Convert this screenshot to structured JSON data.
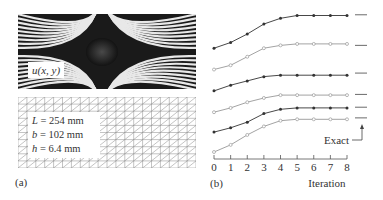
{
  "panel_a": {
    "caption": "(a)",
    "fringe_label": "u(x, y)",
    "params": [
      {
        "sym": "L",
        "text": " = 254 mm"
      },
      {
        "sym": "b",
        "text": " = 102 mm"
      },
      {
        "sym": "h",
        "text": " = 6.4 mm"
      }
    ]
  },
  "panel_b": {
    "caption": "(b)",
    "xlabel": "Iteration",
    "exact_label": "Exact"
  },
  "chart_data": {
    "type": "line",
    "title": "",
    "xlabel": "Iteration",
    "ylabel": "",
    "x": [
      0,
      1,
      2,
      3,
      4,
      5,
      6,
      7,
      8
    ],
    "xlim": [
      0,
      8
    ],
    "grid": false,
    "legend": "none; 'Exact' annotation with arrow pointing to short reference dashes at right",
    "y_units": "relative (no y-axis shown); values are normalized heights 0-1 read from plot",
    "series": [
      {
        "name": "Curve 1",
        "marker": "filled",
        "color": "#333333",
        "values": [
          0.73,
          0.77,
          0.83,
          0.9,
          0.94,
          0.96,
          0.96,
          0.96,
          0.96
        ],
        "exact": 0.965
      },
      {
        "name": "Curve 2",
        "marker": "open",
        "color": "#999999",
        "values": [
          0.58,
          0.61,
          0.67,
          0.73,
          0.75,
          0.76,
          0.76,
          0.76,
          0.76
        ],
        "exact": 0.75
      },
      {
        "name": "Curve 3",
        "marker": "filled",
        "color": "#333333",
        "values": [
          0.43,
          0.47,
          0.5,
          0.53,
          0.54,
          0.54,
          0.54,
          0.54,
          0.54
        ],
        "exact": 0.555
      },
      {
        "name": "Curve 4",
        "marker": "open",
        "color": "#999999",
        "values": [
          0.28,
          0.31,
          0.35,
          0.38,
          0.4,
          0.4,
          0.4,
          0.4,
          0.4
        ],
        "exact": 0.405
      },
      {
        "name": "Curve 5",
        "marker": "filled",
        "color": "#333333",
        "values": [
          0.14,
          0.17,
          0.21,
          0.27,
          0.3,
          0.31,
          0.31,
          0.31,
          0.31
        ],
        "exact": 0.315
      },
      {
        "name": "Curve 6",
        "marker": "open",
        "color": "#999999",
        "values": [
          0.0,
          0.05,
          0.12,
          0.18,
          0.22,
          0.23,
          0.23,
          0.23,
          0.23
        ],
        "exact": 0.24
      }
    ]
  }
}
